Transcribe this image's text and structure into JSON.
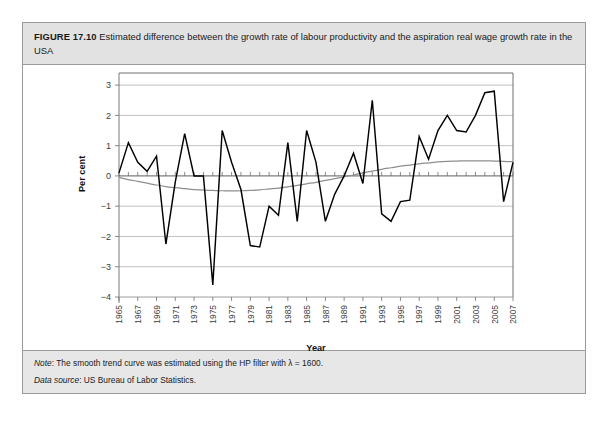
{
  "figure": {
    "label": "FIGURE 17.10",
    "caption": "Estimated difference between the growth rate of labour productivity and the aspiration real wage growth rate in the USA"
  },
  "notes": {
    "note_key": "Note",
    "note_text": ": The smooth trend curve was estimated using the HP filter with λ = 1600.",
    "source_key": "Data source",
    "source_text": ": US Bureau of Labor Statistics."
  },
  "colors": {
    "title_band": "#e2e2e2",
    "notes_band": "#e7e7e7",
    "border": "#9a9a9a",
    "series_main": "#000000",
    "series_trend": "#8e8e8e",
    "gridline": "#b3b3b3"
  },
  "chart_data": {
    "type": "line",
    "title": "Estimated difference between the growth rate of labour productivity and the aspiration real wage growth rate in the USA",
    "xlabel": "Year",
    "ylabel": "Per cent",
    "xlim": [
      1965,
      2007
    ],
    "ylim": [
      -4,
      3.4
    ],
    "yticks": [
      3,
      2,
      1,
      0,
      -1,
      -2,
      -3,
      -4
    ],
    "ytick_labels": [
      "3",
      "2",
      "1",
      "0",
      "−1",
      "−2",
      "−3",
      "−4"
    ],
    "xtick_labels": [
      "1965",
      "1967",
      "1969",
      "1971",
      "1973",
      "1975",
      "1977",
      "1979",
      "1981",
      "1983",
      "1985",
      "1987",
      "1989",
      "1991",
      "1993",
      "1995",
      "1997",
      "1999",
      "2001",
      "2003",
      "2005",
      "2007"
    ],
    "xtick_step_years": 2,
    "minor_tick_step_years": 1,
    "grid": "horizontal",
    "legend": "none",
    "x": [
      1965,
      1966,
      1967,
      1968,
      1969,
      1970,
      1971,
      1972,
      1973,
      1974,
      1975,
      1976,
      1977,
      1978,
      1979,
      1980,
      1981,
      1982,
      1983,
      1984,
      1985,
      1986,
      1987,
      1988,
      1989,
      1990,
      1991,
      1992,
      1993,
      1994,
      1995,
      1996,
      1997,
      1998,
      1999,
      2000,
      2001,
      2002,
      2003,
      2004,
      2005,
      2006,
      2007
    ],
    "series": [
      {
        "name": "Estimated difference",
        "style": "jagged-black",
        "values": [
          0.1,
          1.1,
          0.45,
          0.15,
          0.65,
          -2.25,
          -0.2,
          1.4,
          0.0,
          0.0,
          -3.6,
          1.5,
          0.45,
          -0.45,
          -2.3,
          -2.35,
          -1.0,
          -1.3,
          1.1,
          -1.5,
          1.5,
          0.45,
          -1.5,
          -0.6,
          0.0,
          0.75,
          -0.25,
          2.5,
          -1.25,
          -1.5,
          -0.85,
          -0.8,
          1.3,
          0.55,
          1.5,
          2.0,
          1.5,
          1.45,
          2.0,
          2.75,
          2.8,
          -0.85,
          0.45
        ]
      },
      {
        "name": "HP filter trend (λ = 1600)",
        "style": "smooth-grey",
        "values": [
          -0.05,
          -0.12,
          -0.18,
          -0.24,
          -0.3,
          -0.35,
          -0.39,
          -0.42,
          -0.45,
          -0.47,
          -0.48,
          -0.49,
          -0.49,
          -0.49,
          -0.48,
          -0.46,
          -0.43,
          -0.4,
          -0.36,
          -0.31,
          -0.26,
          -0.21,
          -0.15,
          -0.09,
          -0.03,
          0.03,
          0.1,
          0.16,
          0.22,
          0.27,
          0.32,
          0.36,
          0.4,
          0.43,
          0.46,
          0.48,
          0.49,
          0.5,
          0.5,
          0.5,
          0.49,
          0.48,
          0.47
        ]
      }
    ]
  }
}
